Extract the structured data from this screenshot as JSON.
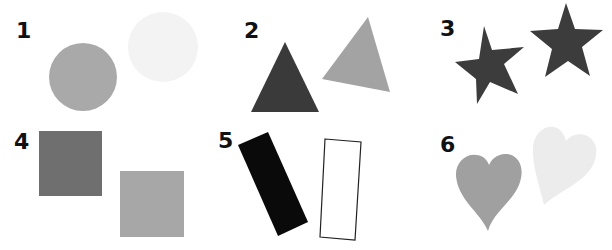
{
  "groups": [
    {
      "number": "1",
      "shape": "circle",
      "items": [
        {
          "fill": "#a9a9a9"
        },
        {
          "fill": "#f3f3f3"
        }
      ]
    },
    {
      "number": "2",
      "shape": "triangle",
      "items": [
        {
          "fill": "#3a3a3a"
        },
        {
          "fill": "#a3a3a3"
        }
      ]
    },
    {
      "number": "3",
      "shape": "star",
      "items": [
        {
          "fill": "#3c3c3c"
        },
        {
          "fill": "#3c3c3c"
        }
      ]
    },
    {
      "number": "4",
      "shape": "square",
      "items": [
        {
          "fill": "#6f6f6f"
        },
        {
          "fill": "#a7a7a7"
        }
      ]
    },
    {
      "number": "5",
      "shape": "rectangle",
      "items": [
        {
          "fill": "#0a0a0a"
        },
        {
          "fill": "#ffffff",
          "stroke": "#222222"
        }
      ]
    },
    {
      "number": "6",
      "shape": "heart",
      "items": [
        {
          "fill": "#a0a0a0"
        },
        {
          "fill": "#ececec"
        }
      ]
    }
  ]
}
